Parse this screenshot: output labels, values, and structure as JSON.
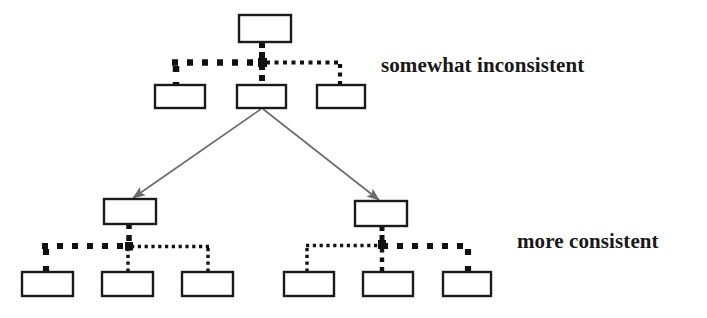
{
  "diagram": {
    "type": "hierarchy-tree",
    "background_color": "#ffffff",
    "box_stroke_color": "#1a1a1a",
    "box_fill_color": "#ffffff",
    "connector_color": "#111111",
    "arrow_color": "#6b6b6b",
    "labels": {
      "top": "somewhat inconsistent",
      "bottom": "more consistent"
    },
    "nodes": [
      {
        "id": "root",
        "name": "root-node",
        "x": 239,
        "y": 15,
        "w": 52,
        "h": 27
      },
      {
        "id": "l2-left",
        "name": "level2-left-node",
        "x": 155,
        "y": 85,
        "w": 50,
        "h": 23
      },
      {
        "id": "l2-middle",
        "name": "level2-middle-node",
        "x": 237,
        "y": 85,
        "w": 49,
        "h": 23
      },
      {
        "id": "l2-right",
        "name": "level2-right-node",
        "x": 317,
        "y": 85,
        "w": 48,
        "h": 23
      },
      {
        "id": "l3-left",
        "name": "level3-left-parent-node",
        "x": 104,
        "y": 199,
        "w": 52,
        "h": 25
      },
      {
        "id": "l3-right",
        "name": "level3-right-parent-node",
        "x": 355,
        "y": 201,
        "w": 52,
        "h": 25
      },
      {
        "id": "l4-a",
        "name": "leaf-node-1",
        "x": 22,
        "y": 272,
        "w": 51,
        "h": 24
      },
      {
        "id": "l4-b",
        "name": "leaf-node-2",
        "x": 102,
        "y": 272,
        "w": 51,
        "h": 24
      },
      {
        "id": "l4-c",
        "name": "leaf-node-3",
        "x": 182,
        "y": 272,
        "w": 51,
        "h": 24
      },
      {
        "id": "l4-d",
        "name": "leaf-node-4",
        "x": 284,
        "y": 272,
        "w": 50,
        "h": 24
      },
      {
        "id": "l4-e",
        "name": "leaf-node-5",
        "x": 363,
        "y": 272,
        "w": 50,
        "h": 24
      },
      {
        "id": "l4-f",
        "name": "leaf-node-6",
        "x": 443,
        "y": 272,
        "w": 48,
        "h": 24
      }
    ],
    "arrows": [
      {
        "name": "arrow-to-left-subtree",
        "x1": 261,
        "y1": 109,
        "x2": 131,
        "y2": 199
      },
      {
        "name": "arrow-to-right-subtree",
        "x1": 263,
        "y1": 109,
        "x2": 381,
        "y2": 201
      }
    ],
    "connector_groups": [
      {
        "name": "connector-group-level2",
        "style": "mixed-thick-left-thin-right"
      },
      {
        "name": "connector-group-left-subtree",
        "style": "mixed-thick-left-thin-right"
      },
      {
        "name": "connector-group-right-subtree",
        "style": "mixed-thin-left-thick-right"
      }
    ]
  }
}
